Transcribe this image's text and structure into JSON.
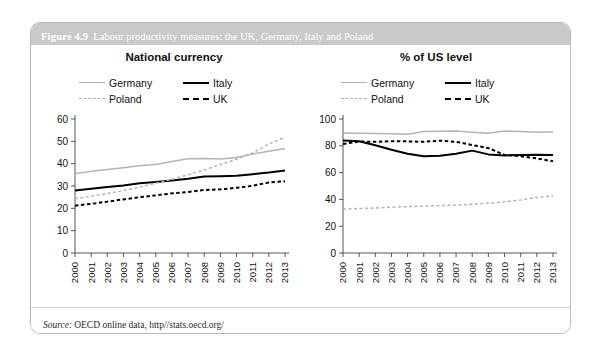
{
  "figure": {
    "number": "Figure 4.9",
    "title": "Labour productivity measures: the UK, Germany, Italy and Poland",
    "source_label": "Source:",
    "source_text": "OECD online data, http//stats.oecd.org/"
  },
  "colors": {
    "title_bar": "#c9c9c9",
    "panel_border": "#b9b9b9",
    "germany": "#b3b3b3",
    "italy": "#000000",
    "poland": "#b3b3b3",
    "uk": "#000000",
    "axis": "#555555"
  },
  "legend": {
    "items": [
      {
        "label": "Germany",
        "style": "solid-gray"
      },
      {
        "label": "Italy",
        "style": "solid-black"
      },
      {
        "label": "Poland",
        "style": "dashed-gray"
      },
      {
        "label": "UK",
        "style": "dashed-black"
      }
    ]
  },
  "chart_data": [
    {
      "type": "line",
      "title": "National currency",
      "xlabel": "",
      "ylabel": "",
      "x": [
        "2000",
        "2001",
        "2002",
        "2003",
        "2004",
        "2005",
        "2006",
        "2007",
        "2008",
        "2009",
        "2010",
        "2011",
        "2012",
        "2013"
      ],
      "ylim": [
        0,
        60
      ],
      "yticks": [
        0,
        10,
        20,
        30,
        40,
        50,
        60
      ],
      "grid": false,
      "legend_position": "top",
      "series": [
        {
          "name": "Germany",
          "values": [
            35.5,
            36.6,
            37.4,
            38.2,
            39.1,
            39.6,
            41.0,
            42.2,
            42.3,
            42.1,
            42.8,
            44.3,
            45.6,
            46.8
          ]
        },
        {
          "name": "Italy",
          "values": [
            28.0,
            28.8,
            29.5,
            30.2,
            31.2,
            31.8,
            32.5,
            33.2,
            34.3,
            34.4,
            34.6,
            35.3,
            36.0,
            36.9
          ]
        },
        {
          "name": "Poland",
          "values": [
            24.3,
            25.4,
            26.6,
            28.0,
            29.5,
            31.2,
            33.0,
            35.0,
            37.2,
            39.6,
            42.0,
            44.8,
            48.8,
            51.8
          ]
        },
        {
          "name": "UK",
          "values": [
            21.2,
            22.0,
            23.0,
            24.0,
            25.0,
            25.8,
            26.7,
            27.3,
            28.2,
            28.5,
            29.2,
            30.1,
            31.6,
            32.1
          ]
        }
      ]
    },
    {
      "type": "line",
      "title": "% of US level",
      "xlabel": "",
      "ylabel": "",
      "x": [
        "2000",
        "2001",
        "2002",
        "2003",
        "2004",
        "2005",
        "2006",
        "2007",
        "2008",
        "2009",
        "2010",
        "2011",
        "2012",
        "2013"
      ],
      "ylim": [
        0,
        100
      ],
      "yticks": [
        0,
        20,
        40,
        60,
        80,
        100
      ],
      "grid": false,
      "legend_position": "top",
      "series": [
        {
          "name": "Germany",
          "values": [
            89.5,
            89.4,
            89.1,
            88.9,
            88.6,
            90.6,
            90.8,
            91.0,
            90.2,
            89.3,
            91.0,
            90.7,
            90.2,
            90.5
          ]
        },
        {
          "name": "Italy",
          "values": [
            84.0,
            83.4,
            80.4,
            77.0,
            74.0,
            72.2,
            72.6,
            74.0,
            76.4,
            73.6,
            72.8,
            73.2,
            73.4,
            73.2
          ]
        },
        {
          "name": "UK",
          "values": [
            81.4,
            83.2,
            83.0,
            83.4,
            83.3,
            83.0,
            83.8,
            83.0,
            80.6,
            78.3,
            73.2,
            72.2,
            70.6,
            68.4
          ]
        },
        {
          "name": "Poland",
          "values": [
            32.8,
            33.2,
            33.6,
            34.2,
            34.6,
            35.0,
            35.4,
            35.8,
            36.4,
            37.2,
            38.2,
            39.6,
            41.4,
            42.6
          ]
        }
      ]
    }
  ]
}
